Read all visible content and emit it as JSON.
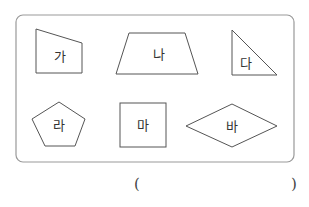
{
  "figure": {
    "border_color": "#999999",
    "stroke_color": "#555555",
    "shapes": [
      {
        "id": "ga",
        "label": "가",
        "kind": "quadrilateral"
      },
      {
        "id": "na",
        "label": "나",
        "kind": "trapezoid"
      },
      {
        "id": "da",
        "label": "다",
        "kind": "right-triangle"
      },
      {
        "id": "ra",
        "label": "라",
        "kind": "pentagon"
      },
      {
        "id": "ma",
        "label": "마",
        "kind": "square"
      },
      {
        "id": "ba",
        "label": "바",
        "kind": "rhombus"
      }
    ]
  },
  "answer": {
    "open_paren": "(",
    "close_paren": ")",
    "value": ""
  }
}
